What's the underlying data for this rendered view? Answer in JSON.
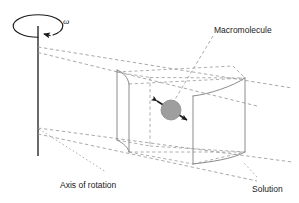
{
  "figure": {
    "type": "scientific-diagram",
    "width": 299,
    "height": 203,
    "background_color": "#ffffff"
  },
  "labels": {
    "macromolecule": "Macromolecule",
    "axis_of_rotation": "Axis of rotation",
    "solution": "Solution",
    "angular_velocity": "ω"
  },
  "colors": {
    "line": "#1a1a1a",
    "dashed_guide": "#9a9a9a",
    "cell_outline": "#8c8c8c",
    "particle_fill": "#9e9e9e",
    "particle_stroke": "#8a8a8a",
    "text": "#1a1a1a"
  },
  "geometry": {
    "axis_line": {
      "x": 38,
      "y_top": 26,
      "y_bottom": 156
    },
    "rotation_ellipse": {
      "cx": 38,
      "cy": 26,
      "rx": 25,
      "ry": 11
    },
    "rotation_arrow_direction": "counterclockwise-top-left",
    "particle": {
      "cx": 171,
      "cy": 110,
      "r": 10
    },
    "diffusion_arrow": {
      "x1": 151,
      "y1": 96,
      "x2": 192,
      "y2": 123
    },
    "cell_near_wall_x": 117,
    "cell_far_wall_x": 245,
    "leader_macromolecule": {
      "x1": 213,
      "y1": 36,
      "x2": 174,
      "y2": 101
    },
    "leader_axis": {
      "x1": 39,
      "y1": 129,
      "x2": 106,
      "y2": 172
    },
    "leader_solution": {
      "x1": 257,
      "y1": 178,
      "x2": 243,
      "y2": 163
    }
  },
  "text_positions": {
    "macromolecule": {
      "x": 214,
      "y": 33
    },
    "axis_of_rotation": {
      "x": 60,
      "y": 188
    },
    "solution": {
      "x": 252,
      "y": 192
    },
    "omega": {
      "x": 63,
      "y": 24
    }
  }
}
